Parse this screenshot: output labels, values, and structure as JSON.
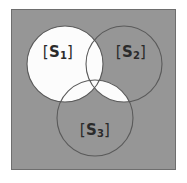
{
  "figure": {
    "type": "venn-diagram",
    "set_count": 3,
    "panel": {
      "background_color": "#969696",
      "border_color": "#6e6e6e",
      "x": 11,
      "y": 9,
      "width": 165,
      "height": 161
    },
    "page_background_color": "#ffffff",
    "fill_color": "#fcfcfc",
    "stroke_color": "#5a5a5a",
    "label_color": "#2b2b2b",
    "circle_radius": 38,
    "sets": [
      {
        "id": "s1",
        "label_open_bracket": "[",
        "label_base": "S",
        "label_subscript": "1",
        "label_close_bracket": "]",
        "label_text": "[S1]",
        "cx": 65,
        "cy": 64,
        "r": 38,
        "filled": true,
        "label_x": 58,
        "label_y": 52
      },
      {
        "id": "s2",
        "label_open_bracket": "[",
        "label_base": "S",
        "label_subscript": "2",
        "label_close_bracket": "]",
        "label_text": "[S2]",
        "cx": 124,
        "cy": 64,
        "r": 38,
        "filled": false,
        "label_x": 131,
        "label_y": 52
      },
      {
        "id": "s3",
        "label_open_bracket": "[",
        "label_base": "S",
        "label_subscript": "3",
        "label_close_bracket": "]",
        "label_text": "[S3]",
        "cx": 95,
        "cy": 118,
        "r": 38,
        "filled": false,
        "label_x": 95,
        "label_y": 130
      }
    ],
    "filled_regions": [
      "s1",
      "s2-intersect-s3"
    ]
  }
}
